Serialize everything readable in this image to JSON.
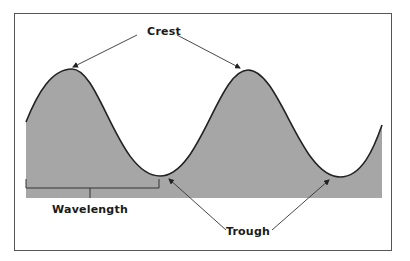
{
  "diagram": {
    "labels": {
      "crest": "Crest",
      "trough": "Trough",
      "wavelength": "Wavelength"
    },
    "colors": {
      "fill": "#a6a6a6",
      "line": "#222222",
      "frame": "#555555",
      "background": "#ffffff"
    }
  }
}
